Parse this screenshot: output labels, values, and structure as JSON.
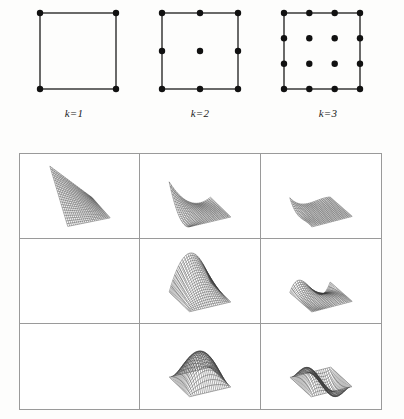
{
  "figure": {
    "kind": "scientific-figure",
    "background_color": "#fdfdfc",
    "ink_color": "#1a1a1a",
    "rule_color": "#9a9a9a"
  },
  "node_diagrams": [
    {
      "id": "k1",
      "label": "k=1",
      "order": 1,
      "nodes_per_side": 2,
      "node_count": 4,
      "node_positions": [
        [
          0,
          0
        ],
        [
          1,
          0
        ],
        [
          0,
          1
        ],
        [
          1,
          1
        ]
      ]
    },
    {
      "id": "k2",
      "label": "k=2",
      "order": 2,
      "nodes_per_side": 3,
      "node_count": 9,
      "node_positions": [
        [
          0,
          0
        ],
        [
          0.5,
          0
        ],
        [
          1,
          0
        ],
        [
          0,
          0.5
        ],
        [
          0.5,
          0.5
        ],
        [
          1,
          0.5
        ],
        [
          0,
          1
        ],
        [
          0.5,
          1
        ],
        [
          1,
          1
        ]
      ]
    },
    {
      "id": "k3",
      "label": "k=3",
      "order": 3,
      "nodes_per_side": 4,
      "node_count": 16,
      "node_positions": [
        [
          0,
          0
        ],
        [
          0.3333,
          0
        ],
        [
          0.6667,
          0
        ],
        [
          1,
          0
        ],
        [
          0,
          0.3333
        ],
        [
          0.3333,
          0.3333
        ],
        [
          0.6667,
          0.3333
        ],
        [
          1,
          0.3333
        ],
        [
          0,
          0.6667
        ],
        [
          0.3333,
          0.6667
        ],
        [
          0.6667,
          0.6667
        ],
        [
          1,
          0.6667
        ],
        [
          0,
          1
        ],
        [
          0.3333,
          1
        ],
        [
          0.6667,
          1
        ],
        [
          1,
          1
        ]
      ]
    }
  ],
  "surface_table": {
    "rows": 3,
    "columns": 3,
    "column_orders": [
      1,
      2,
      3
    ],
    "row_kinds": [
      "vertex",
      "edge",
      "interior"
    ],
    "cells": [
      {
        "row": 0,
        "col": 0,
        "empty": false,
        "kind": "vertex",
        "order": 1,
        "shape": "bilinear-plane"
      },
      {
        "row": 0,
        "col": 1,
        "empty": false,
        "kind": "vertex",
        "order": 2,
        "shape": "quadratic-corner-peak"
      },
      {
        "row": 0,
        "col": 2,
        "empty": false,
        "kind": "vertex",
        "order": 3,
        "shape": "cubic-corner-spike"
      },
      {
        "row": 1,
        "col": 0,
        "empty": true,
        "kind": "edge",
        "order": 1,
        "shape": "none"
      },
      {
        "row": 1,
        "col": 1,
        "empty": false,
        "kind": "edge",
        "order": 2,
        "shape": "edge-ridge"
      },
      {
        "row": 1,
        "col": 2,
        "empty": false,
        "kind": "edge",
        "order": 3,
        "shape": "edge-spike-flat-plate"
      },
      {
        "row": 2,
        "col": 0,
        "empty": true,
        "kind": "interior",
        "order": 1,
        "shape": "none"
      },
      {
        "row": 2,
        "col": 1,
        "empty": false,
        "kind": "interior",
        "order": 2,
        "shape": "single-bubble-dome"
      },
      {
        "row": 2,
        "col": 2,
        "empty": false,
        "kind": "interior",
        "order": 3,
        "shape": "double-lobe-bubble"
      }
    ]
  }
}
